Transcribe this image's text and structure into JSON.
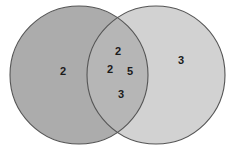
{
  "figure": {
    "type": "venn-diagram",
    "width": 233,
    "height": 149,
    "background_color": "#ffffff"
  },
  "colors": {
    "left_circle_fill": "#acacac",
    "right_circle_fill": "#d2d2d2",
    "intersection_fill": "#b6b6b6",
    "outline": "#555555",
    "label_text": "#1b1b1b"
  },
  "circles": {
    "left": {
      "cx": 79,
      "cy": 75,
      "r": 69
    },
    "right": {
      "cx": 156,
      "cy": 75,
      "r": 69
    }
  },
  "regions": {
    "left_only": {
      "name": "left-only-region",
      "labels": [
        {
          "value": "2",
          "x": 63,
          "y": 72
        }
      ]
    },
    "intersection": {
      "name": "intersection-region",
      "labels": [
        {
          "value": "2",
          "x": 118,
          "y": 52
        },
        {
          "value": "2",
          "x": 110,
          "y": 70
        },
        {
          "value": "5",
          "x": 130,
          "y": 72
        },
        {
          "value": "3",
          "x": 121,
          "y": 95
        }
      ]
    },
    "right_only": {
      "name": "right-only-region",
      "labels": [
        {
          "value": "3",
          "x": 181,
          "y": 61
        }
      ]
    }
  },
  "chart_data": {
    "type": "venn",
    "title": "",
    "sets": [
      "Left",
      "Right"
    ],
    "region_values": {
      "left_only": [
        2
      ],
      "intersection": [
        2,
        2,
        5,
        3
      ],
      "right_only": [
        3
      ]
    },
    "left_only_total": 2,
    "intersection_total": 12,
    "right_only_total": 3,
    "all_numbers": [
      2,
      2,
      2,
      5,
      3,
      3
    ]
  }
}
